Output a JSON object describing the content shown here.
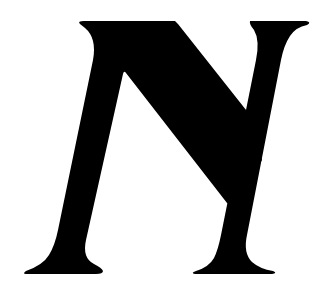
{
  "image": {
    "description": "Black serif letterform glyph on white background (mirrored/italic N shape)",
    "glyph_color": "#000000",
    "background_color": "#ffffff"
  }
}
